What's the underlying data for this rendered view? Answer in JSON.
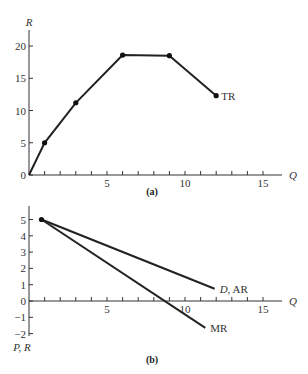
{
  "chart_data": [
    {
      "type": "line",
      "panel_label": "(a)",
      "xlabel": "Q",
      "ylabel": "R",
      "xlim": [
        0,
        16
      ],
      "ylim": [
        0,
        22
      ],
      "xticks": [
        1,
        2,
        3,
        4,
        5,
        6,
        7,
        8,
        9,
        10,
        11,
        12,
        13,
        14,
        15
      ],
      "xtick_labels": [
        {
          "v": 5,
          "t": "5"
        },
        {
          "v": 10,
          "t": "10"
        },
        {
          "v": 15,
          "t": "15"
        }
      ],
      "yticks": [
        {
          "v": 0,
          "t": "0"
        },
        {
          "v": 5,
          "t": "5"
        },
        {
          "v": 10,
          "t": "10"
        },
        {
          "v": 15,
          "t": "15"
        },
        {
          "v": 20,
          "t": "20"
        }
      ],
      "grid": false,
      "series": [
        {
          "name": "TR",
          "label": "TR",
          "x": [
            0,
            1,
            3,
            6,
            9,
            12
          ],
          "y": [
            0,
            5,
            11.2,
            18.6,
            18.5,
            12.3
          ],
          "markers_at": [
            1,
            3,
            6,
            9,
            12
          ]
        }
      ]
    },
    {
      "type": "line",
      "panel_label": "(b)",
      "xlabel": "Q",
      "ylabel": "P, R",
      "xlim": [
        0,
        16
      ],
      "ylim": [
        -2,
        5.5
      ],
      "xticks": [
        1,
        2,
        3,
        4,
        5,
        6,
        7,
        8,
        9,
        10,
        11,
        12,
        13,
        14,
        15
      ],
      "xtick_labels": [
        {
          "v": 5,
          "t": "5"
        },
        {
          "v": 10,
          "t": "10"
        },
        {
          "v": 15,
          "t": "15"
        }
      ],
      "yticks": [
        {
          "v": -2,
          "t": "−2"
        },
        {
          "v": -1,
          "t": "−1"
        },
        {
          "v": 0,
          "t": "0"
        },
        {
          "v": 1,
          "t": "1"
        },
        {
          "v": 2,
          "t": "2"
        },
        {
          "v": 3,
          "t": "3"
        },
        {
          "v": 4,
          "t": "4"
        },
        {
          "v": 5,
          "t": "5"
        }
      ],
      "grid": false,
      "series": [
        {
          "name": "D, AR",
          "label_italic": "D",
          "label_rest": ", AR",
          "x": [
            0.8,
            11.9
          ],
          "y": [
            5,
            0.75
          ]
        },
        {
          "name": "MR",
          "label": "MR",
          "x": [
            0.8,
            11.3
          ],
          "y": [
            5,
            -1.65
          ]
        }
      ],
      "start_marker": {
        "x": 0.8,
        "y": 5
      }
    }
  ]
}
